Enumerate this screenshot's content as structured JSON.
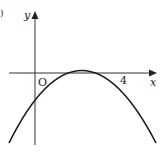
{
  "diagram": {
    "type": "function-graph",
    "labels": {
      "y_axis": "y",
      "x_axis": "x",
      "origin": "O",
      "root": "4",
      "corner_mark": ")"
    },
    "curve": {
      "kind": "parabola",
      "roots": [
        0,
        4
      ],
      "opens": "down",
      "color": "#1a1a1a"
    },
    "axis_color": "#333333"
  }
}
